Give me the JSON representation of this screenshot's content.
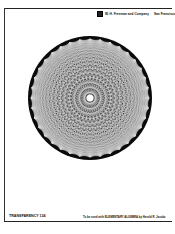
{
  "header": {
    "logo_icon": "publisher-logo-icon",
    "publisher": "W. H. Freeman and Company",
    "city": "San Francisco",
    "faint_title": "· · · · · · · · · ·"
  },
  "figure": {
    "colors": {
      "disc": "#0a0a0a",
      "lines": "#ffffff",
      "paper": "#ffffff"
    }
  },
  "footer": {
    "label": "TRANSPARENCY 134",
    "credit": "To be used with ELEMENTARY ALGEBRA by Harold R. Jacobs"
  }
}
